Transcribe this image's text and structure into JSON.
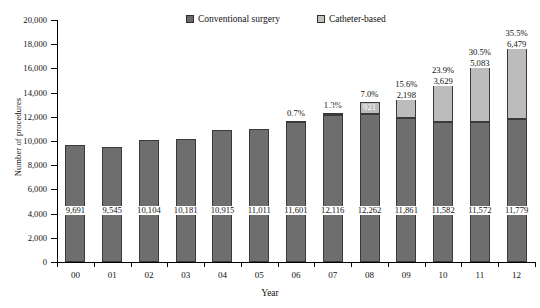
{
  "chart_data": {
    "type": "bar",
    "subtype": "stacked-vertical",
    "title": "",
    "xlabel": "Year",
    "ylabel": "Number of procedures",
    "ylim": [
      0,
      20000
    ],
    "ytick_step": 2000,
    "ytick_labels": [
      "0",
      "2,000",
      "4,000",
      "6,000",
      "8,000",
      "10,000",
      "12,000",
      "14,000",
      "16,000",
      "18,000",
      "20,000"
    ],
    "grid": false,
    "legend_position": "top-center",
    "categories": [
      "00",
      "01",
      "02",
      "03",
      "04",
      "05",
      "06",
      "07",
      "08",
      "09",
      "10",
      "11",
      "12"
    ],
    "series": [
      {
        "name": "Conventional surgery",
        "color": "#6e6e6e",
        "values": [
          9691,
          9545,
          10104,
          10181,
          10915,
          11011,
          11601,
          12116,
          12262,
          11861,
          11582,
          11572,
          11779
        ],
        "labels": [
          "9,691",
          "9,545",
          "10,104",
          "10,181",
          "10,915",
          "11,011",
          "11,601",
          "12,116",
          "12,262",
          "11,861",
          "11,582",
          "11,572",
          "11,779"
        ]
      },
      {
        "name": "Catheter-based",
        "color": "#bcbcbc",
        "values": [
          0,
          0,
          0,
          0,
          0,
          0,
          78,
          157,
          921,
          2198,
          3629,
          5083,
          6479
        ],
        "labels": [
          "",
          "",
          "",
          "",
          "",
          "",
          "78",
          "157",
          "921",
          "2,198",
          "3,629",
          "5,083",
          "6,479"
        ]
      }
    ],
    "annotations": {
      "percent_labels": [
        "",
        "",
        "",
        "",
        "",
        "",
        "0.7%",
        "1.3%",
        "7.0%",
        "15.6%",
        "23.9%",
        "30.5%",
        "35.5%"
      ]
    }
  },
  "legend": {
    "items": [
      {
        "label": "Conventional surgery",
        "swatch": "dark"
      },
      {
        "label": "Catheter-based",
        "swatch": "light"
      }
    ]
  },
  "axes": {
    "x_title": "Year",
    "y_title": "Number of procedures"
  }
}
